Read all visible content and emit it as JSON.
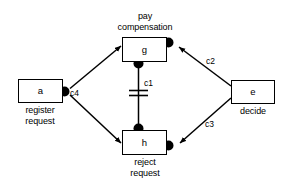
{
  "diagram": {
    "colors": {
      "stroke": "#000000",
      "fill": "#ffffff",
      "binding_dot": "#000000"
    },
    "nodes": [
      {
        "id": "a",
        "label": "a",
        "caption": "register\nrequest",
        "caption_position": "below"
      },
      {
        "id": "g",
        "label": "g",
        "caption": "pay\ncompensation",
        "caption_position": "above"
      },
      {
        "id": "h",
        "label": "h",
        "caption": "reject\nrequest",
        "caption_position": "below"
      },
      {
        "id": "e",
        "label": "e",
        "caption": "decide",
        "caption_position": "below"
      }
    ],
    "arcs": [
      {
        "id": "c1",
        "label": "c1",
        "from": "g",
        "to": "h",
        "style": "double-bar"
      },
      {
        "id": "c2",
        "label": "c2",
        "from": "e",
        "to": "g",
        "style": "arrow"
      },
      {
        "id": "c3",
        "label": "c3",
        "from": "e",
        "to": "h",
        "style": "arrow"
      },
      {
        "id": "c4",
        "label": "c4",
        "from": "a",
        "to": "g,h",
        "style": "arrow"
      }
    ],
    "binding_dots": [
      {
        "id": "dot-a-right",
        "on_node": "a",
        "edge": "right"
      },
      {
        "id": "dot-g-right",
        "on_node": "g",
        "edge": "right"
      },
      {
        "id": "dot-g-bottom",
        "on_node": "g",
        "edge": "bottom"
      },
      {
        "id": "dot-h-top",
        "on_node": "h",
        "edge": "top"
      },
      {
        "id": "dot-h-right",
        "on_node": "h",
        "edge": "right"
      }
    ]
  }
}
